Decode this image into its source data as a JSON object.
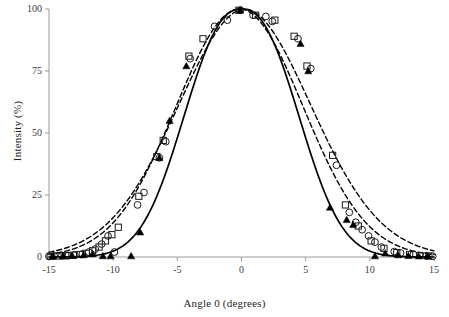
{
  "chart_data": {
    "type": "scatter",
    "title": "",
    "subtitle": "",
    "xlabel": "Angle 0 (degrees)",
    "ylabel": "Intensity (%)",
    "xlim": [
      -15,
      15
    ],
    "ylim": [
      0,
      100
    ],
    "xticks": [
      -15,
      -10,
      -5,
      0,
      5,
      10,
      15
    ],
    "yticks": [
      0,
      25,
      50,
      75,
      100
    ],
    "xtick_labels": [
      "-15",
      "-10",
      "-5",
      "0",
      "5",
      "10",
      "15"
    ],
    "ytick_labels": [
      "0",
      "25",
      "50",
      "75",
      "100"
    ],
    "grid": false,
    "legend": "none",
    "annotations": [],
    "series": [
      {
        "name": "open-circles",
        "marker": "open-circle",
        "line": "none",
        "color": "#1a1a1a",
        "x": [
          -15.0,
          -14.6,
          -14.0,
          -13.5,
          -13.0,
          -12.4,
          -11.9,
          -11.4,
          -10.9,
          -10.4,
          -9.9,
          -8.1,
          -7.6,
          -6.4,
          -5.9,
          -4.0,
          -2.1,
          -1.1,
          -0.1,
          0.9,
          1.9,
          2.4,
          4.4,
          5.4,
          7.4,
          8.4,
          8.9,
          9.4,
          9.9,
          10.4,
          10.9,
          11.9,
          12.4,
          13.4,
          14.4,
          14.9
        ],
        "y": [
          0.3,
          0.4,
          0.5,
          0.6,
          0.9,
          1.2,
          2.0,
          3.2,
          5.2,
          8.5,
          2.0,
          21.0,
          26.0,
          40.0,
          46.5,
          80.0,
          93.0,
          95.5,
          99.5,
          97.5,
          97.0,
          95.0,
          88.0,
          76.0,
          37.0,
          18.0,
          14.0,
          11.0,
          8.5,
          6.0,
          4.0,
          2.2,
          1.6,
          1.0,
          0.5,
          0.3
        ]
      },
      {
        "name": "open-squares",
        "marker": "open-square",
        "line": "none",
        "color": "#1a1a1a",
        "x": [
          -14.9,
          -14.3,
          -13.7,
          -13.1,
          -12.6,
          -12.1,
          -11.6,
          -11.1,
          -10.6,
          -10.1,
          -9.6,
          -8.0,
          -6.6,
          -6.1,
          -4.1,
          -3.0,
          -0.2,
          1.1,
          2.6,
          4.1,
          5.1,
          7.1,
          8.1,
          9.1,
          10.1,
          11.1,
          12.1,
          13.1,
          13.9,
          14.6
        ],
        "y": [
          0.3,
          0.4,
          0.5,
          0.7,
          1.0,
          1.5,
          2.5,
          4.0,
          6.5,
          9.0,
          12.0,
          24.5,
          40.5,
          47.0,
          81.0,
          88.0,
          99.5,
          97.5,
          95.5,
          89.0,
          77.0,
          41.0,
          21.0,
          12.5,
          6.5,
          3.5,
          1.8,
          1.0,
          0.6,
          0.4
        ]
      },
      {
        "name": "filled-triangles",
        "marker": "filled-triangle",
        "line": "none",
        "color": "#000000",
        "x": [
          -14.7,
          -13.9,
          -13.2,
          -12.3,
          -11.6,
          -10.8,
          -10.2,
          -8.6,
          -7.9,
          -6.4,
          -5.6,
          -4.3,
          -0.1,
          4.6,
          5.2,
          6.9,
          8.2,
          8.7,
          10.4,
          11.2,
          12.2,
          13.0,
          13.8,
          14.5
        ],
        "y": [
          0.3,
          0.4,
          0.6,
          0.8,
          1.2,
          0.4,
          0.4,
          0.4,
          10.0,
          40.0,
          55.0,
          77.0,
          99.5,
          86.0,
          75.0,
          20.0,
          15.0,
          13.0,
          0.4,
          1.5,
          0.8,
          0.5,
          0.4,
          0.3
        ]
      }
    ],
    "curves": [
      {
        "name": "solid-fit",
        "style": "solid",
        "color": "#000000",
        "center": 0.0,
        "sigma": 4.25,
        "amplitude": 100,
        "shape_exponent": 2.35
      },
      {
        "name": "dashed-fit-1",
        "style": "dashed",
        "color": "#000000",
        "center": -0.15,
        "sigma": 4.95,
        "amplitude": 100,
        "shape_exponent": 2.0
      },
      {
        "name": "dashed-fit-2",
        "style": "dashed",
        "color": "#000000",
        "center": 0.25,
        "sigma": 5.2,
        "amplitude": 100,
        "shape_exponent": 1.92
      }
    ]
  },
  "axes": {
    "x_title": "Angle 0 (degrees)",
    "y_title": "Intensity (%)",
    "x_tick_labels": [
      "-15",
      "-10",
      "-5",
      "0",
      "5",
      "10",
      "15"
    ],
    "y_tick_labels": [
      "0",
      "25",
      "50",
      "75",
      "100"
    ],
    "axis_color": "#9a9a9a"
  }
}
